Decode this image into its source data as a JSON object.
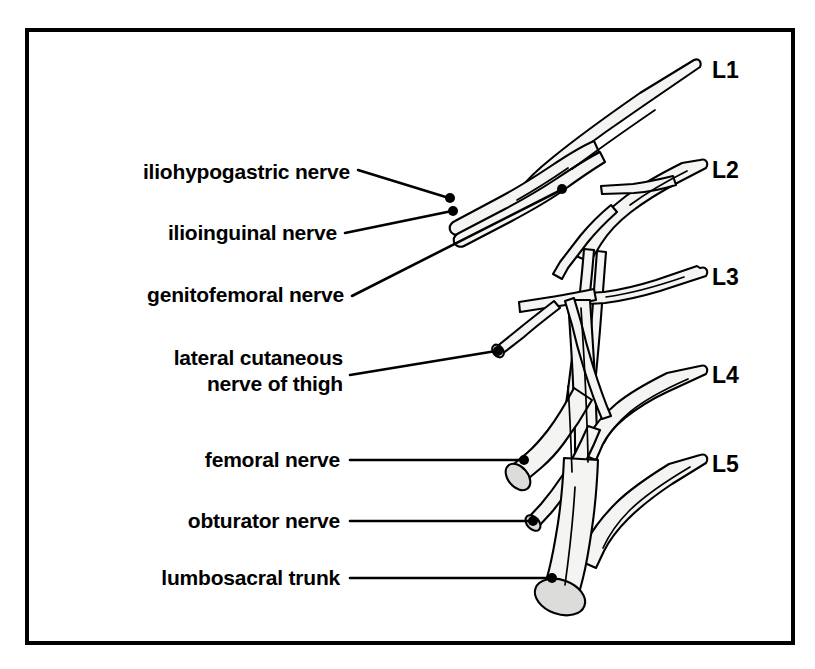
{
  "figure": {
    "frame": {
      "color": "#000000"
    },
    "background": "#ffffff",
    "nerve_fill": "#f4f4f2",
    "cut_face_fill": "#dcdcda",
    "line_color": "#000000"
  },
  "nerve_labels": [
    {
      "id": "iliohypogastric",
      "text": "iliohypogastric nerve",
      "lines": [
        "iliohypogastric nerve"
      ]
    },
    {
      "id": "ilioinguinal",
      "text": "ilioinguinal nerve",
      "lines": [
        "ilioinguinal nerve"
      ]
    },
    {
      "id": "genitofemoral",
      "text": "genitofemoral nerve",
      "lines": [
        "genitofemoral nerve"
      ]
    },
    {
      "id": "lateral-cutaneous-thigh",
      "text": "lateral cutaneous nerve of thigh",
      "lines": [
        "lateral cutaneous",
        "nerve of thigh"
      ]
    },
    {
      "id": "femoral",
      "text": "femoral nerve",
      "lines": [
        "femoral nerve"
      ]
    },
    {
      "id": "obturator",
      "text": "obturator nerve",
      "lines": [
        "obturator nerve"
      ]
    },
    {
      "id": "lumbosacral-trunk",
      "text": "lumbosacral trunk",
      "lines": [
        "lumbosacral trunk"
      ]
    }
  ],
  "label_line_1_1": "iliohypogastric nerve",
  "label_line_2_1": "ilioinguinal nerve",
  "label_line_3_1": "genitofemoral nerve",
  "label_line_4_1": "lateral cutaneous",
  "label_line_4_2": "nerve of thigh",
  "label_line_5_1": "femoral nerve",
  "label_line_6_1": "obturator nerve",
  "label_line_7_1": "lumbosacral trunk",
  "root_labels": [
    {
      "id": "L1",
      "text": "L1"
    },
    {
      "id": "L2",
      "text": "L2"
    },
    {
      "id": "L3",
      "text": "L3"
    },
    {
      "id": "L4",
      "text": "L4"
    },
    {
      "id": "L5",
      "text": "L5"
    }
  ],
  "root_L1": "L1",
  "root_L2": "L2",
  "root_L3": "L3",
  "root_L4": "L4",
  "root_L5": "L5"
}
